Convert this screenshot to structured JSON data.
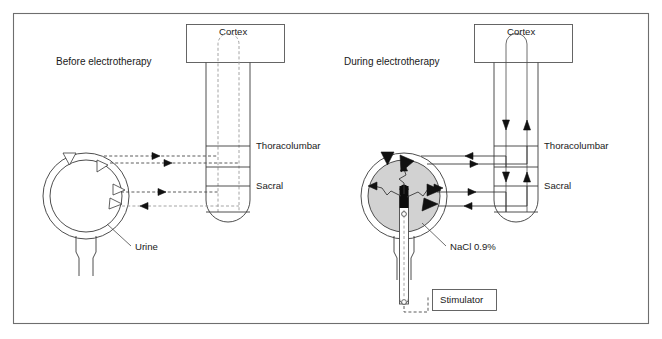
{
  "figure": {
    "background_color": "#ffffff",
    "frame_color": "#6e6e6e",
    "width": 662,
    "height": 339
  },
  "panels": [
    {
      "id": "before",
      "caption": "Before electrotherapy",
      "cortex_label": "Cortex",
      "cord_segments": [
        {
          "name": "thoracolumbar",
          "label": "Thoracolumbar"
        },
        {
          "name": "sacral",
          "label": "Sacral"
        }
      ],
      "bladder_content_label": "Urine",
      "bladder_fill_color": "#ffffff",
      "signal_style": "dashed",
      "arrowhead_style": "open",
      "stimulator_label": null,
      "catheter_present": false
    },
    {
      "id": "during",
      "caption": "During electrotherapy",
      "cortex_label": "Cortex",
      "cord_segments": [
        {
          "name": "thoracolumbar",
          "label": "Thoracolumbar"
        },
        {
          "name": "sacral",
          "label": "Sacral"
        }
      ],
      "bladder_content_label": "NaCl 0.9%",
      "bladder_fill_color": "#d2d2d2",
      "signal_style": "solid",
      "arrowhead_style": "filled",
      "stimulator_label": "Stimulator",
      "catheter_present": true
    }
  ],
  "labels": {
    "cortex": "Cortex",
    "thoracolumbar": "Thoracolumbar",
    "sacral": "Sacral",
    "urine": "Urine",
    "nacl": "NaCl 0.9%",
    "stimulator": "Stimulator",
    "before_caption": "Before electrotherapy",
    "during_caption": "During electrotherapy"
  },
  "colors": {
    "line": "#3a3a3a",
    "dashed": "#4a4a4a",
    "dashed_light": "#9a9a9a",
    "saline_fill": "#d2d2d2",
    "electrode": "#0d0d0d",
    "frame": "#6e6e6e",
    "text": "#1a1a1a"
  }
}
